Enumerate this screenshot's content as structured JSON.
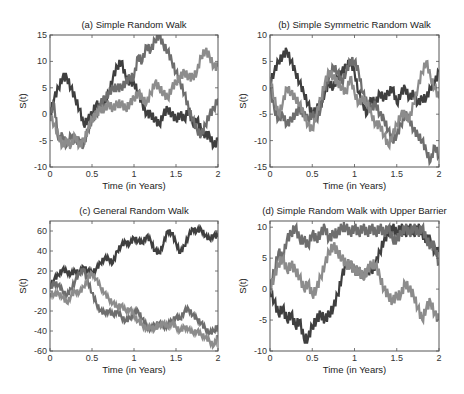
{
  "chart_data": [
    {
      "type": "line",
      "title": "(a) Simple Random Walk",
      "xlabel": "Time (in Years)",
      "ylabel": "S(t)",
      "xlim": [
        0,
        2
      ],
      "ylim": [
        -10,
        15
      ],
      "xticks": [
        0,
        0.5,
        1,
        1.5,
        2
      ],
      "xtick_labels": [
        "0",
        "0.5",
        "1",
        "1.5",
        "2"
      ],
      "yticks": [
        -10,
        -5,
        0,
        5,
        10,
        15
      ],
      "ytick_labels": [
        "-10",
        "-5",
        "0",
        "5",
        "10",
        "15"
      ],
      "x": [
        0,
        0.05,
        0.1,
        0.15,
        0.2,
        0.25,
        0.3,
        0.35,
        0.4,
        0.45,
        0.5,
        0.55,
        0.6,
        0.65,
        0.7,
        0.75,
        0.8,
        0.85,
        0.9,
        0.95,
        1.0,
        1.05,
        1.1,
        1.15,
        1.2,
        1.25,
        1.3,
        1.35,
        1.4,
        1.45,
        1.5,
        1.55,
        1.6,
        1.65,
        1.7,
        1.75,
        1.8,
        1.85,
        1.9,
        1.95,
        2.0
      ],
      "series": [
        {
          "name": "walk-1",
          "color": "#3f3f3f",
          "values": [
            0,
            3,
            5,
            7,
            7,
            5,
            3,
            1,
            -2,
            -1,
            0,
            2,
            1,
            2,
            4,
            7,
            9,
            10,
            7,
            6,
            6,
            4,
            2,
            0,
            0,
            -1,
            -2,
            0,
            1,
            0,
            -1,
            0,
            -1,
            1,
            -2,
            -1,
            -3,
            -4,
            -4,
            -6,
            -5
          ]
        },
        {
          "name": "walk-2",
          "color": "#6e6e6e",
          "values": [
            0,
            2,
            -5,
            -4,
            -6,
            -4,
            -5,
            -5,
            -6,
            -3,
            -1,
            0,
            2,
            3,
            4,
            5,
            5,
            5,
            6,
            7,
            7,
            11,
            10,
            13,
            12,
            14,
            15,
            13,
            12,
            10,
            8,
            6,
            4,
            1,
            -1,
            -3,
            -4,
            -2,
            0,
            1,
            3
          ]
        },
        {
          "name": "walk-3",
          "color": "#8c8c8c",
          "values": [
            0,
            -2,
            -4,
            -6,
            -5,
            -6,
            -4,
            -6,
            -5,
            -3,
            -1,
            0,
            1,
            1,
            2,
            1,
            2,
            2,
            1,
            2,
            3,
            4,
            3,
            2,
            4,
            6,
            5,
            4,
            3,
            5,
            6,
            7,
            8,
            7,
            7,
            8,
            11,
            12,
            11,
            9,
            9
          ]
        }
      ]
    },
    {
      "type": "line",
      "title": "(b) Simple Symmetric Random Walk",
      "xlabel": "Time (in Years)",
      "ylabel": "S(t)",
      "xlim": [
        0,
        2
      ],
      "ylim": [
        -15,
        10
      ],
      "xticks": [
        0,
        0.5,
        1,
        1.5,
        2
      ],
      "xtick_labels": [
        "0",
        "0.5",
        "1",
        "1.5",
        "2"
      ],
      "yticks": [
        -15,
        -10,
        -5,
        0,
        5,
        10
      ],
      "ytick_labels": [
        "-15",
        "-10",
        "-5",
        "0",
        "5",
        "10"
      ],
      "x": [
        0,
        0.05,
        0.1,
        0.15,
        0.2,
        0.25,
        0.3,
        0.35,
        0.4,
        0.45,
        0.5,
        0.55,
        0.6,
        0.65,
        0.7,
        0.75,
        0.8,
        0.85,
        0.9,
        0.95,
        1.0,
        1.05,
        1.1,
        1.15,
        1.2,
        1.25,
        1.3,
        1.35,
        1.4,
        1.45,
        1.5,
        1.55,
        1.6,
        1.65,
        1.7,
        1.75,
        1.8,
        1.85,
        1.9,
        1.95,
        2.0
      ],
      "series": [
        {
          "name": "walk-1",
          "color": "#3f3f3f",
          "values": [
            1,
            3,
            5,
            6,
            7,
            5,
            3,
            1,
            -1,
            -3,
            -5,
            -4,
            -3,
            -1,
            1,
            0,
            2,
            3,
            4,
            5,
            3,
            -1,
            -3,
            -5,
            -2,
            -3,
            -1,
            -2,
            -1,
            0,
            -3,
            -1,
            0,
            -2,
            -1,
            -3,
            -2,
            -2,
            0,
            1,
            3
          ]
        },
        {
          "name": "walk-2",
          "color": "#6e6e6e",
          "values": [
            0,
            -4,
            -6,
            -5,
            -7,
            -6,
            -5,
            -4,
            -5,
            -6,
            -5,
            -6,
            -4,
            0,
            2,
            4,
            3,
            1,
            3,
            5,
            5,
            3,
            -1,
            -3,
            -4,
            -3,
            -5,
            -6,
            -8,
            -10,
            -9,
            -7,
            -5,
            -6,
            -8,
            -9,
            -10,
            -12,
            -14,
            -11,
            -13
          ]
        },
        {
          "name": "walk-3",
          "color": "#8c8c8c",
          "values": [
            2,
            -2,
            -5,
            -3,
            0,
            -1,
            -2,
            -3,
            -5,
            -7,
            -8,
            -5,
            -2,
            1,
            3,
            2,
            1,
            0,
            -1,
            2,
            -1,
            -3,
            -2,
            -3,
            -5,
            -7,
            -7,
            -9,
            -11,
            -9,
            -7,
            -5,
            -5,
            -6,
            -3,
            0,
            3,
            5,
            2,
            0,
            -2
          ]
        }
      ]
    },
    {
      "type": "line",
      "title": "(c) General Random Walk",
      "xlabel": "Time (in Years)",
      "ylabel": "S(t)",
      "xlim": [
        0,
        2
      ],
      "ylim": [
        -60,
        70
      ],
      "xticks": [
        0,
        0.5,
        1,
        1.5,
        2
      ],
      "xtick_labels": [
        "0",
        "0.5",
        "1",
        "1.5",
        "2"
      ],
      "yticks": [
        -60,
        -40,
        -20,
        0,
        20,
        40,
        60
      ],
      "ytick_labels": [
        "-60",
        "-40",
        "-20",
        "0",
        "20",
        "40",
        "60"
      ],
      "x": [
        0,
        0.05,
        0.1,
        0.15,
        0.2,
        0.25,
        0.3,
        0.35,
        0.4,
        0.45,
        0.5,
        0.55,
        0.6,
        0.65,
        0.7,
        0.75,
        0.8,
        0.85,
        0.9,
        0.95,
        1.0,
        1.05,
        1.1,
        1.15,
        1.2,
        1.25,
        1.3,
        1.35,
        1.4,
        1.45,
        1.5,
        1.55,
        1.6,
        1.65,
        1.7,
        1.75,
        1.8,
        1.85,
        1.9,
        1.95,
        2.0
      ],
      "series": [
        {
          "name": "walk-1",
          "color": "#3f3f3f",
          "values": [
            5,
            12,
            16,
            22,
            19,
            17,
            20,
            18,
            24,
            20,
            18,
            22,
            28,
            33,
            32,
            28,
            40,
            46,
            49,
            47,
            53,
            50,
            48,
            55,
            50,
            40,
            38,
            47,
            60,
            58,
            48,
            38,
            45,
            55,
            62,
            60,
            62,
            55,
            52,
            56,
            54
          ]
        },
        {
          "name": "walk-2",
          "color": "#6e6e6e",
          "values": [
            2,
            8,
            6,
            0,
            -5,
            2,
            10,
            18,
            22,
            10,
            -2,
            -12,
            -20,
            -22,
            -20,
            -24,
            -20,
            -26,
            -30,
            -27,
            -22,
            -20,
            -28,
            -35,
            -38,
            -34,
            -32,
            -36,
            -34,
            -30,
            -26,
            -28,
            -20,
            -18,
            -24,
            -28,
            -32,
            -38,
            -42,
            -40,
            -34
          ]
        },
        {
          "name": "walk-3",
          "color": "#8c8c8c",
          "values": [
            -2,
            -4,
            -2,
            -6,
            -12,
            -5,
            0,
            -2,
            4,
            12,
            18,
            12,
            4,
            -2,
            -8,
            -12,
            -16,
            -14,
            -20,
            -18,
            -24,
            -30,
            -34,
            -38,
            -36,
            -38,
            -34,
            -32,
            -36,
            -32,
            -36,
            -40,
            -36,
            -38,
            -42,
            -40,
            -44,
            -46,
            -50,
            -55,
            -45
          ]
        }
      ]
    },
    {
      "type": "line",
      "title": "(d) Simple Random Walk with Upper Barrier",
      "xlabel": "Time (in Years)",
      "ylabel": "S(t)",
      "xlim": [
        0,
        2
      ],
      "ylim": [
        -10,
        11
      ],
      "xticks": [
        0,
        0.5,
        1,
        1.5,
        2
      ],
      "xtick_labels": [
        "0",
        "0.5",
        "1",
        "1.5",
        "2"
      ],
      "yticks": [
        -10,
        -5,
        0,
        5,
        10
      ],
      "ytick_labels": [
        "-10",
        "-5",
        "0",
        "5",
        "10"
      ],
      "upper_barrier": 10,
      "x": [
        0,
        0.05,
        0.1,
        0.15,
        0.2,
        0.25,
        0.3,
        0.35,
        0.4,
        0.45,
        0.5,
        0.55,
        0.6,
        0.65,
        0.7,
        0.75,
        0.8,
        0.85,
        0.9,
        0.95,
        1.0,
        1.05,
        1.1,
        1.15,
        1.2,
        1.25,
        1.3,
        1.35,
        1.4,
        1.45,
        1.5,
        1.55,
        1.6,
        1.65,
        1.7,
        1.75,
        1.8,
        1.85,
        1.9,
        1.95,
        2.0
      ],
      "series": [
        {
          "name": "walk-1",
          "color": "#3f3f3f",
          "values": [
            0,
            -2,
            -4,
            -3,
            -5,
            -4,
            -6,
            -5,
            -8,
            -8,
            -6,
            -5,
            -4,
            -5,
            -4,
            -3,
            -1,
            2,
            4,
            4,
            3,
            3,
            2,
            3,
            3,
            4,
            6,
            8,
            9,
            10,
            9,
            10,
            9,
            10,
            9,
            10,
            9,
            8,
            8,
            6,
            6
          ]
        },
        {
          "name": "walk-2",
          "color": "#6e6e6e",
          "values": [
            0,
            3,
            6,
            5,
            8,
            9,
            10,
            8,
            8,
            7,
            9,
            8,
            9,
            10,
            8,
            9,
            9,
            10,
            10,
            9,
            10,
            9,
            10,
            9,
            10,
            9,
            10,
            9,
            10,
            8,
            8,
            9,
            10,
            9,
            10,
            9,
            10,
            8,
            7,
            7,
            4
          ]
        },
        {
          "name": "walk-3",
          "color": "#8c8c8c",
          "values": [
            0,
            2,
            4,
            5,
            3,
            4,
            3,
            2,
            0,
            1,
            -1,
            0,
            2,
            4,
            6,
            7,
            6,
            5,
            4,
            4,
            3,
            3,
            2,
            3,
            4,
            4,
            2,
            0,
            -1,
            -2,
            -1,
            -1,
            1,
            0,
            -1,
            -3,
            -5,
            -3,
            -2,
            -4,
            -5
          ]
        }
      ]
    }
  ]
}
